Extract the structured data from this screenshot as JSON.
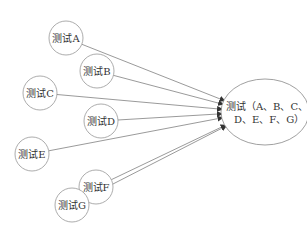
{
  "diagram": {
    "sources": [
      {
        "id": "A",
        "label": "测试A",
        "cx": 66,
        "cy": 38
      },
      {
        "id": "B",
        "label": "测试B",
        "cx": 97,
        "cy": 71
      },
      {
        "id": "C",
        "label": "测试C",
        "cx": 40,
        "cy": 93
      },
      {
        "id": "D",
        "label": "测试D",
        "cx": 101,
        "cy": 121
      },
      {
        "id": "E",
        "label": "测试E",
        "cx": 32,
        "cy": 154
      },
      {
        "id": "F",
        "label": "测试F",
        "cx": 96,
        "cy": 187
      },
      {
        "id": "G",
        "label": "测试G",
        "cx": 72,
        "cy": 205
      }
    ],
    "target": {
      "label_line1": "测试（A、B、C、",
      "label_line2": "D、E、F、G）",
      "cx": 265,
      "cy": 112,
      "rx": 44,
      "ry": 33
    },
    "edge_color": "#555555",
    "node_stroke": "#888888"
  }
}
